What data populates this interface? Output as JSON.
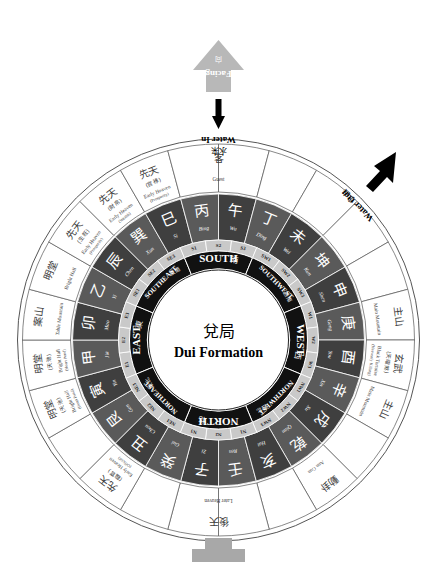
{
  "title": {
    "chinese": "兌局",
    "english": "Dui Formation"
  },
  "annotations": {
    "facing": {
      "chinese": "向",
      "english": "Facing"
    },
    "water_in": {
      "chinese": "水来",
      "english": "Water In"
    },
    "water_out": {
      "chinese": "水去",
      "english": "Water Out"
    }
  },
  "cardinals": [
    {
      "english": "EAST",
      "chinese": "東",
      "angle": 270,
      "sectors": [
        "E1",
        "E2",
        "E3"
      ]
    },
    {
      "english": "SOUTHEAST",
      "chinese": "東南",
      "angle": 315,
      "sectors": [
        "SE1",
        "SE2",
        "SE3"
      ]
    },
    {
      "english": "SOUTH",
      "chinese": "南",
      "angle": 0,
      "sectors": [
        "S1",
        "S2",
        "S3"
      ]
    },
    {
      "english": "SOUTHWEST",
      "chinese": "西南",
      "angle": 45,
      "sectors": [
        "SW1",
        "SW2",
        "SW3"
      ]
    },
    {
      "english": "WEST",
      "chinese": "西",
      "angle": 90,
      "sectors": [
        "W1",
        "W2",
        "W3"
      ]
    },
    {
      "english": "NORTHWEST",
      "chinese": "西北",
      "angle": 135,
      "sectors": [
        "NW1",
        "NW2",
        "NW3"
      ]
    },
    {
      "english": "NORTH",
      "chinese": "北",
      "angle": 180,
      "sectors": [
        "N1",
        "N2",
        "N3"
      ]
    },
    {
      "english": "NORTHEAST",
      "chinese": "東北",
      "angle": 225,
      "sectors": [
        "NE1",
        "NE2",
        "NE3"
      ]
    }
  ],
  "mountains": [
    {
      "chinese": "壬",
      "pinyin": "Ren",
      "angle": 172.5,
      "shade": "dark"
    },
    {
      "chinese": "子",
      "pinyin": "Zi",
      "angle": 187.5,
      "shade": "dark"
    },
    {
      "chinese": "癸",
      "pinyin": "Gui",
      "angle": 202.5,
      "shade": "dark"
    },
    {
      "chinese": "丑",
      "pinyin": "Chou",
      "angle": 217.5,
      "shade": "dark"
    },
    {
      "chinese": "艮",
      "pinyin": "Gen",
      "angle": 232.5,
      "shade": "dark"
    },
    {
      "chinese": "寅",
      "pinyin": "Yin",
      "angle": 247.5,
      "shade": "dark"
    },
    {
      "chinese": "甲",
      "pinyin": "Jia",
      "angle": 262.5,
      "shade": "dark"
    },
    {
      "chinese": "卯",
      "pinyin": "Mao",
      "angle": 277.5,
      "shade": "dark"
    },
    {
      "chinese": "乙",
      "pinyin": "Yi",
      "angle": 292.5,
      "shade": "dark"
    },
    {
      "chinese": "辰",
      "pinyin": "Chen",
      "angle": 307.5,
      "shade": "dark"
    },
    {
      "chinese": "巽",
      "pinyin": "Xun",
      "angle": 322.5,
      "shade": "dark"
    },
    {
      "chinese": "巳",
      "pinyin": "Si",
      "angle": 337.5,
      "shade": "dark"
    },
    {
      "chinese": "丙",
      "pinyin": "Bing",
      "angle": 352.5,
      "shade": "dark"
    },
    {
      "chinese": "午",
      "pinyin": "Wu",
      "angle": 7.5,
      "shade": "dark"
    },
    {
      "chinese": "丁",
      "pinyin": "Ding",
      "angle": 22.5,
      "shade": "dark"
    },
    {
      "chinese": "未",
      "pinyin": "Wei",
      "angle": 37.5,
      "shade": "dark"
    },
    {
      "chinese": "坤",
      "pinyin": "Kun",
      "angle": 52.5,
      "shade": "dark"
    },
    {
      "chinese": "申",
      "pinyin": "Shen",
      "angle": 67.5,
      "shade": "dark"
    },
    {
      "chinese": "庚",
      "pinyin": "Geng",
      "angle": 82.5,
      "shade": "dark"
    },
    {
      "chinese": "酉",
      "pinyin": "You",
      "angle": 97.5,
      "shade": "dark"
    },
    {
      "chinese": "辛",
      "pinyin": "Xin",
      "angle": 112.5,
      "shade": "dark"
    },
    {
      "chinese": "戌",
      "pinyin": "Xu",
      "angle": 127.5,
      "shade": "dark"
    },
    {
      "chinese": "乾",
      "pinyin": "Qian",
      "angle": 142.5,
      "shade": "dark"
    },
    {
      "chinese": "亥",
      "pinyin": "Hai",
      "angle": 157.5,
      "shade": "dark"
    }
  ],
  "outer_segments": [
    {
      "chinese": "明堂",
      "english": "Bright Hall",
      "sub": "(天池)",
      "sub_en": "(Heart Pond)",
      "angle": 262.5
    },
    {
      "chinese": "案山",
      "english": "Table Mountain",
      "sub": "",
      "sub_en": "",
      "angle": 277.5
    },
    {
      "chinese": "明堂",
      "english": "Bright Hall",
      "sub": "",
      "sub_en": "",
      "angle": 292.5
    },
    {
      "chinese": "先天",
      "english": "Early Heaven",
      "sub": "(生旺)",
      "sub_en": "(Prosperity)",
      "angle": 307.5
    },
    {
      "chinese": "先天",
      "english": "Early Heaven",
      "sub": "(財帛)",
      "sub_en": "(Wealth)",
      "angle": 322.5
    },
    {
      "chinese": "先天",
      "english": "Early Heaven",
      "sub": "(官祿)",
      "sub_en": "(Prosperity)",
      "angle": 337.5
    },
    {
      "chinese": "客",
      "english": "Guest",
      "sub": "",
      "sub_en": "",
      "angle": 0
    },
    {
      "chinese": "主山",
      "english": "Main Mountain",
      "sub": "",
      "sub_en": "",
      "angle": 82.5
    },
    {
      "chinese": "玄武",
      "english": "Black Tortoise",
      "sub": "(天曜煞)",
      "sub_en": "(Heavenly Killing)",
      "angle": 97.5
    },
    {
      "chinese": "主山",
      "english": "Main Mountain",
      "sub": "",
      "sub_en": "",
      "angle": 112.5
    },
    {
      "chinese": "動卦",
      "english": "Ann Gua",
      "sub": "",
      "sub_en": "",
      "angle": 142.5
    },
    {
      "chinese": "後天",
      "english": "Later Heaven",
      "sub": "",
      "sub_en": "",
      "angle": 180
    },
    {
      "chinese": "先天",
      "english": "Early Heaven",
      "sub": "(臨官)",
      "sub_en": "(Official)",
      "angle": 217.5
    },
    {
      "chinese": "明堂",
      "english": "Bright Hall",
      "sub": "(天池)",
      "sub_en": "(Heart Pond)",
      "angle": 247.5
    }
  ],
  "colors": {
    "ring_dark": "#5a5a5a",
    "ring_darker": "#3f3f3f",
    "ring_band": "#111111",
    "ring_mid": "#8e8e8e",
    "ring_light": "#c9c9c9",
    "outline": "#555555",
    "arrow_fill": "#b8b8b8",
    "base_fill": "#a8a8a8"
  }
}
